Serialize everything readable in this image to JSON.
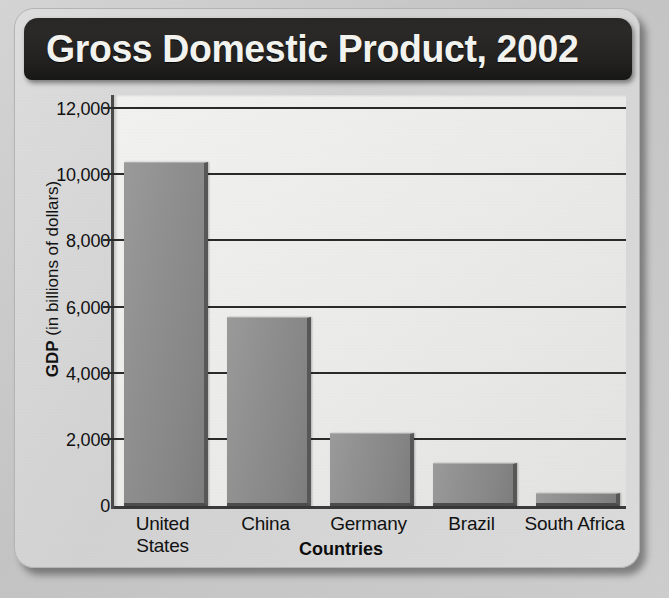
{
  "chart_data": {
    "type": "bar",
    "title": "Gross Domestic Product, 2002",
    "xlabel": "Countries",
    "ylabel": "GDP (in billions of dollars)",
    "ylabel_bold_part": "GDP",
    "ylabel_rest": " (in billions of dollars)",
    "categories": [
      "United States",
      "China",
      "Germany",
      "Brazil",
      "South Africa"
    ],
    "category_lines": [
      [
        "United",
        "States"
      ],
      [
        "China"
      ],
      [
        "Germany"
      ],
      [
        "Brazil"
      ],
      [
        "South Africa"
      ]
    ],
    "values": [
      10400,
      5700,
      2200,
      1300,
      400
    ],
    "ylim": [
      0,
      12000
    ],
    "ytick_values": [
      0,
      2000,
      4000,
      6000,
      8000,
      10000,
      12000
    ],
    "ytick_labels": [
      "0",
      "2,000",
      "4,000",
      "6,000",
      "8,000",
      "10,000",
      "12,000"
    ],
    "grid": true,
    "legend": false,
    "bar_color": "#8e8e8e",
    "plot_background": "#ecebe9",
    "title_background": "#262524",
    "title_color": "#f2f2ee"
  }
}
